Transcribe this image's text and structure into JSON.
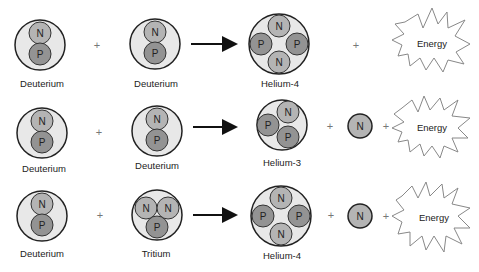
{
  "colors": {
    "nucleus_fill": "#e8e8e8",
    "neutron_fill": "#b4b4b4",
    "proton_fill": "#939393",
    "outline": "#222222",
    "burst_stroke": "#888888"
  },
  "symbols": {
    "plus": "+",
    "neutron": "N",
    "proton": "P",
    "energy": "Energy"
  },
  "reactions": [
    {
      "reactant1": "Deuterium",
      "reactant2": "Deuterium",
      "product": "Helium-4",
      "extra_neutron": false,
      "energy": "Energy"
    },
    {
      "reactant1": "Deuterium",
      "reactant2": "Deuterium",
      "product": "Helium-3",
      "extra_neutron": true,
      "energy": "Energy"
    },
    {
      "reactant1": "Deuterium",
      "reactant2": "Tritium",
      "product": "Helium-4",
      "extra_neutron": true,
      "energy": "Energy"
    }
  ]
}
